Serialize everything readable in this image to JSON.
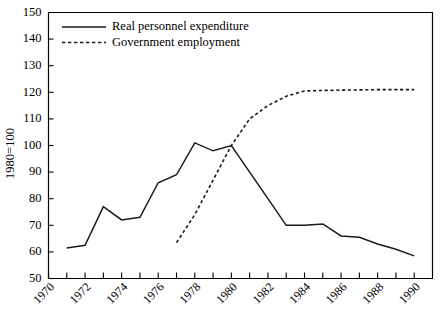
{
  "chart_data": {
    "type": "line",
    "title": "",
    "xlabel": "",
    "ylabel": "1980=100",
    "xlim": [
      1970,
      1991
    ],
    "ylim": [
      50,
      150
    ],
    "ytick_step": 10,
    "yticks": [
      50,
      60,
      70,
      80,
      90,
      100,
      110,
      120,
      130,
      140,
      150
    ],
    "xticks": [
      1970,
      1971,
      1972,
      1973,
      1974,
      1975,
      1976,
      1977,
      1978,
      1979,
      1980,
      1981,
      1982,
      1983,
      1984,
      1985,
      1986,
      1987,
      1988,
      1989,
      1990
    ],
    "xtick_labels": [
      "1970",
      "",
      "1972",
      "",
      "1974",
      "",
      "1976",
      "",
      "1978",
      "",
      "1980",
      "",
      "1982",
      "",
      "1984",
      "",
      "1986",
      "",
      "1988",
      "",
      "1990"
    ],
    "grid": false,
    "legend_position": "top-left",
    "series": [
      {
        "name": "Real personnel expenditure",
        "style": "solid",
        "color": "#1a1a1a",
        "x": [
          1971,
          1972,
          1973,
          1974,
          1975,
          1976,
          1977,
          1978,
          1979,
          1980,
          1981,
          1982,
          1983,
          1984,
          1985,
          1986,
          1987,
          1988,
          1989,
          1990
        ],
        "values": [
          61.5,
          62.5,
          77.0,
          72.0,
          73.0,
          86.0,
          89.0,
          101.0,
          98.0,
          100.0,
          90.0,
          80.0,
          70.0,
          70.0,
          70.5,
          66.0,
          65.5,
          63.0,
          61.0,
          58.5
        ]
      },
      {
        "name": "Government employment",
        "style": "dashed",
        "color": "#1a1a1a",
        "x": [
          1977,
          1978,
          1979,
          1980,
          1981,
          1982,
          1983,
          1984,
          1985,
          1986,
          1987,
          1988,
          1989,
          1990
        ],
        "values": [
          63.5,
          74.0,
          87.0,
          100.0,
          110.0,
          115.0,
          118.5,
          120.5,
          120.7,
          120.8,
          120.9,
          121.0,
          121.0,
          121.0
        ]
      }
    ]
  },
  "legend": {
    "entries": [
      {
        "label": "Real personnel expenditure",
        "style": "solid"
      },
      {
        "label": "Government employment",
        "style": "dashed"
      }
    ]
  },
  "axis": {
    "y_label": "1980=100"
  }
}
